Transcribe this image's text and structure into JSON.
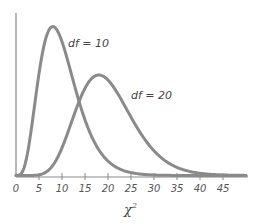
{
  "chart_data": {
    "type": "line",
    "title": "",
    "xlabel": "χ",
    "xlabel_superscript": "2",
    "ylabel": "",
    "xlim": [
      0,
      50
    ],
    "x_ticks": [
      0,
      5,
      10,
      15,
      20,
      25,
      30,
      35,
      40,
      45
    ],
    "grid": false,
    "legend": "inline labels",
    "series": [
      {
        "name": "df = 10",
        "df": 10,
        "mode": 8,
        "color": "#8a8a8a"
      },
      {
        "name": "df = 20",
        "df": 20,
        "mode": 18,
        "color": "#8a8a8a"
      }
    ],
    "annotations": [
      {
        "text": "df = 10",
        "near_x": 13
      },
      {
        "text": "df = 20",
        "near_x": 26
      }
    ]
  }
}
